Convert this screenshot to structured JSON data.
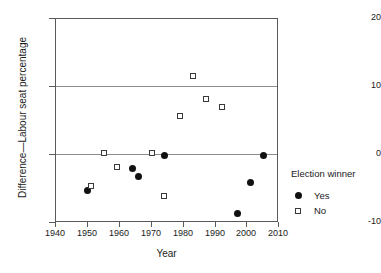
{
  "chart_data": {
    "type": "scatter",
    "title": "",
    "xlabel": "Year",
    "ylabel": "Difference—Labour seat percentage",
    "xlim": [
      1940,
      2010
    ],
    "ylim": [
      -10,
      20
    ],
    "xticks": [
      1940,
      1950,
      1960,
      1970,
      1980,
      1990,
      2000,
      2010
    ],
    "yticks": [
      -10,
      0,
      10,
      20
    ],
    "grid": "horizontal gridlines at y=0 and y=10",
    "legend_position": "right",
    "series": [
      {
        "name": "Yes",
        "marker": "filled-circle",
        "color": "#111111",
        "points": [
          {
            "x": 1950,
            "y": -5.2
          },
          {
            "x": 1964,
            "y": -2.0
          },
          {
            "x": 1966,
            "y": -3.1
          },
          {
            "x": 1974,
            "y": 0.0
          },
          {
            "x": 1997,
            "y": -8.6
          },
          {
            "x": 2001,
            "y": -4.0
          },
          {
            "x": 2005,
            "y": 0.0
          }
        ]
      },
      {
        "name": "No",
        "marker": "open-square",
        "color": "#3a3a3a",
        "points": [
          {
            "x": 1951,
            "y": -4.6
          },
          {
            "x": 1955,
            "y": 0.3
          },
          {
            "x": 1959,
            "y": -1.8
          },
          {
            "x": 1970,
            "y": 0.3
          },
          {
            "x": 1974,
            "y": -6.0
          },
          {
            "x": 1979,
            "y": 5.7
          },
          {
            "x": 1983,
            "y": 11.6
          },
          {
            "x": 1987,
            "y": 8.3
          },
          {
            "x": 1992,
            "y": 7.1
          }
        ]
      }
    ]
  },
  "axes": {
    "x_tick_labels": [
      "1940",
      "1950",
      "1960",
      "1970",
      "1980",
      "1990",
      "2000",
      "2010"
    ],
    "y_tick_labels": [
      "20",
      "10",
      "0",
      "-10"
    ],
    "x_title": "Year",
    "y_title": "Difference—Labour seat percentage"
  },
  "legend": {
    "title": "Election winner",
    "entries": [
      {
        "label": "Yes",
        "symbol": "filled-circle"
      },
      {
        "label": "No",
        "symbol": "open-square"
      }
    ]
  }
}
